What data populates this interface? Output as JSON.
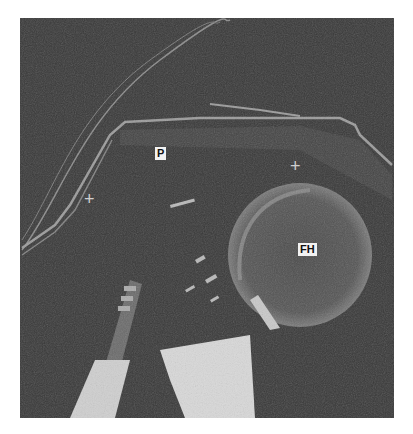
{
  "image": {
    "type": "ultrasound",
    "background_color": "#3a3a3a",
    "labels": [
      {
        "text": "P",
        "x": 155,
        "y": 147
      },
      {
        "text": "FH",
        "x": 298,
        "y": 243
      }
    ],
    "markers": [
      {
        "symbol": "+",
        "x": 90,
        "y": 199
      },
      {
        "symbol": "+",
        "x": 296,
        "y": 166
      }
    ]
  }
}
